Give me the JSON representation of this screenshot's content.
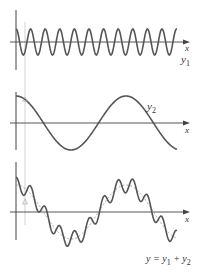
{
  "figure": {
    "panels": [
      {
        "id": "y1",
        "curve_label": "y",
        "curve_label_sub": "1",
        "axis_label": "x",
        "description": "high-frequency sinusoid",
        "axis_y": 42,
        "amplitude_px": 13,
        "period_px": 14.6,
        "phase": "cos"
      },
      {
        "id": "y2",
        "curve_label": "y",
        "curve_label_sub": "2",
        "axis_label": "x",
        "description": "low-frequency sinusoid",
        "axis_y": 123,
        "amplitude_px": 27,
        "period_px": 110,
        "phase": "cos"
      },
      {
        "id": "sum",
        "curve_label": "y = y",
        "curve_label_sub1": "1",
        "curve_label_mid": " + y",
        "curve_label_sub2": "2",
        "axis_label": "x",
        "description": "superposition of y1 and y2 with dashed y2 envelope",
        "axis_y": 212
      }
    ],
    "colors": {
      "curve": "#555555",
      "axis": "#444444",
      "guide": "#bbbbbb",
      "dashed": "#888888"
    }
  }
}
